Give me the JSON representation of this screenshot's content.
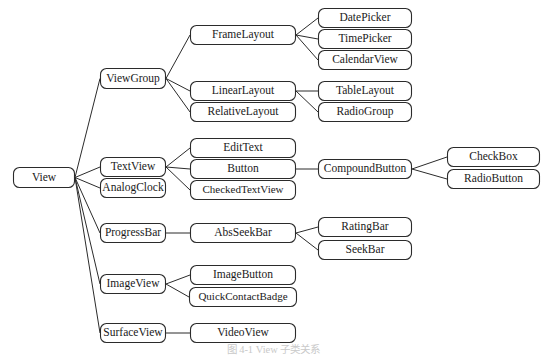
{
  "diagram": {
    "caption": "图 4-1 View 子类关系",
    "root_label": "View",
    "colors": {
      "box_stroke": "#2b2b2b",
      "box_fill": "#ffffff",
      "line": "#2b2b2b",
      "text": "#1a1a1a",
      "caption_text": "#c9c9c9",
      "background": "#ffffff"
    },
    "nodes": [
      {
        "id": "view",
        "label": "View",
        "x": 13,
        "y": 167,
        "w": 62,
        "h": 21
      },
      {
        "id": "viewgroup",
        "label": "ViewGroup",
        "x": 100,
        "y": 68,
        "w": 66,
        "h": 21
      },
      {
        "id": "textview",
        "label": "TextView",
        "x": 100,
        "y": 157,
        "w": 66,
        "h": 20
      },
      {
        "id": "analogclock",
        "label": "AnalogClock",
        "x": 100,
        "y": 178,
        "w": 66,
        "h": 20
      },
      {
        "id": "progressbar",
        "label": "ProgressBar",
        "x": 100,
        "y": 223,
        "w": 66,
        "h": 20
      },
      {
        "id": "imageview",
        "label": "ImageView",
        "x": 100,
        "y": 274,
        "w": 66,
        "h": 20
      },
      {
        "id": "surfaceview",
        "label": "SurfaceView",
        "x": 100,
        "y": 323,
        "w": 66,
        "h": 20
      },
      {
        "id": "framelayout",
        "label": "FrameLayout",
        "x": 190,
        "y": 25,
        "w": 106,
        "h": 20
      },
      {
        "id": "linearlayout",
        "label": "LinearLayout",
        "x": 190,
        "y": 81,
        "w": 106,
        "h": 20
      },
      {
        "id": "relativelayout",
        "label": "RelativeLayout",
        "x": 190,
        "y": 102,
        "w": 106,
        "h": 20
      },
      {
        "id": "edittext",
        "label": "EditText",
        "x": 190,
        "y": 138,
        "w": 106,
        "h": 20
      },
      {
        "id": "button",
        "label": "Button",
        "x": 190,
        "y": 159,
        "w": 106,
        "h": 20
      },
      {
        "id": "checkedtextview",
        "label": "CheckedTextView",
        "x": 190,
        "y": 180,
        "w": 106,
        "h": 20
      },
      {
        "id": "absseekbar",
        "label": "AbsSeekBar",
        "x": 190,
        "y": 223,
        "w": 106,
        "h": 20
      },
      {
        "id": "imagebutton",
        "label": "ImageButton",
        "x": 190,
        "y": 265,
        "w": 106,
        "h": 20
      },
      {
        "id": "quickcontactbadge",
        "label": "QuickContactBadge",
        "x": 189,
        "y": 287,
        "w": 108,
        "h": 20
      },
      {
        "id": "videoview",
        "label": "VideoView",
        "x": 190,
        "y": 323,
        "w": 106,
        "h": 20
      },
      {
        "id": "datepicker",
        "label": "DatePicker",
        "x": 318,
        "y": 8,
        "w": 94,
        "h": 20
      },
      {
        "id": "timepicker",
        "label": "TimePicker",
        "x": 318,
        "y": 29,
        "w": 94,
        "h": 20
      },
      {
        "id": "calendarview",
        "label": "CalendarView",
        "x": 318,
        "y": 50,
        "w": 94,
        "h": 20
      },
      {
        "id": "tablelayout",
        "label": "TableLayout",
        "x": 318,
        "y": 81,
        "w": 94,
        "h": 20
      },
      {
        "id": "radiogroup",
        "label": "RadioGroup",
        "x": 318,
        "y": 102,
        "w": 94,
        "h": 20
      },
      {
        "id": "compoundbutton",
        "label": "CompoundButton",
        "x": 318,
        "y": 159,
        "w": 94,
        "h": 20
      },
      {
        "id": "ratingbar",
        "label": "RatingBar",
        "x": 318,
        "y": 217,
        "w": 94,
        "h": 20
      },
      {
        "id": "seekbar",
        "label": "SeekBar",
        "x": 318,
        "y": 240,
        "w": 94,
        "h": 20
      },
      {
        "id": "checkbox",
        "label": "CheckBox",
        "x": 447,
        "y": 147,
        "w": 93,
        "h": 20
      },
      {
        "id": "radiobutton",
        "label": "RadioButton",
        "x": 447,
        "y": 169,
        "w": 93,
        "h": 20
      }
    ],
    "edges": [
      {
        "from": "view",
        "to": "viewgroup"
      },
      {
        "from": "view",
        "to": "textview"
      },
      {
        "from": "view",
        "to": "analogclock"
      },
      {
        "from": "view",
        "to": "progressbar"
      },
      {
        "from": "view",
        "to": "imageview"
      },
      {
        "from": "view",
        "to": "surfaceview"
      },
      {
        "from": "viewgroup",
        "to": "framelayout"
      },
      {
        "from": "viewgroup",
        "to": "linearlayout"
      },
      {
        "from": "viewgroup",
        "to": "relativelayout"
      },
      {
        "from": "framelayout",
        "to": "datepicker"
      },
      {
        "from": "framelayout",
        "to": "timepicker"
      },
      {
        "from": "framelayout",
        "to": "calendarview"
      },
      {
        "from": "linearlayout",
        "to": "tablelayout"
      },
      {
        "from": "linearlayout",
        "to": "radiogroup"
      },
      {
        "from": "textview",
        "to": "edittext"
      },
      {
        "from": "textview",
        "to": "button"
      },
      {
        "from": "textview",
        "to": "checkedtextview"
      },
      {
        "from": "button",
        "to": "compoundbutton"
      },
      {
        "from": "compoundbutton",
        "to": "checkbox"
      },
      {
        "from": "compoundbutton",
        "to": "radiobutton"
      },
      {
        "from": "progressbar",
        "to": "absseekbar"
      },
      {
        "from": "absseekbar",
        "to": "ratingbar"
      },
      {
        "from": "absseekbar",
        "to": "seekbar"
      },
      {
        "from": "imageview",
        "to": "imagebutton"
      },
      {
        "from": "imageview",
        "to": "quickcontactbadge"
      },
      {
        "from": "surfaceview",
        "to": "videoview"
      }
    ]
  }
}
